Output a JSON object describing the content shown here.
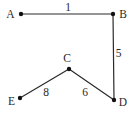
{
  "diagram": {
    "type": "weighted-graph",
    "background_color": "#ffffff",
    "line_color": "#2a2a2a",
    "node_dot_color": "#111111",
    "text_color": "#2a2a2a",
    "node_dot_radius": 2.2,
    "edge_stroke_width": 1.2,
    "font_size": 11.5,
    "nodes": [
      {
        "id": "A",
        "x": 21,
        "y": 14,
        "label": "A",
        "label_x": 10.5,
        "label_y": 14
      },
      {
        "id": "B",
        "x": 113,
        "y": 14,
        "label": "B",
        "label_x": 123,
        "label_y": 13.5
      },
      {
        "id": "C",
        "x": 69,
        "y": 69,
        "label": "C",
        "label_x": 67,
        "label_y": 57.5
      },
      {
        "id": "D",
        "x": 114,
        "y": 100,
        "label": "D",
        "label_x": 123,
        "label_y": 102
      },
      {
        "id": "E",
        "x": 20,
        "y": 98,
        "label": "E",
        "label_x": 11.5,
        "label_y": 101
      }
    ],
    "edges": [
      {
        "from": "A",
        "to": "B",
        "weight": "1",
        "label_x": 68,
        "label_y": 6.5
      },
      {
        "from": "B",
        "to": "D",
        "weight": "5",
        "label_x": 118.5,
        "label_y": 53
      },
      {
        "from": "C",
        "to": "D",
        "weight": "6",
        "label_x": 85,
        "label_y": 91.5
      },
      {
        "from": "C",
        "to": "E",
        "weight": "8",
        "label_x": 46,
        "label_y": 91.5
      }
    ]
  }
}
